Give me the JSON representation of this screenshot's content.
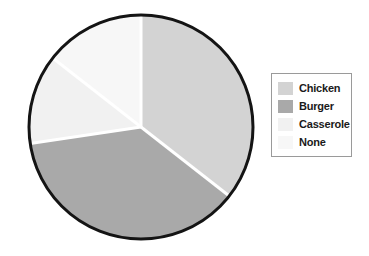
{
  "chart_data": {
    "type": "pie",
    "title": "",
    "labels": [
      "Chicken",
      "Burger",
      "Casserole",
      "None"
    ],
    "values": [
      35.6,
      37.1,
      12.9,
      14.4
    ],
    "angles_deg": [
      128.0,
      133.5,
      46.5,
      52.0
    ],
    "start_angle_deg": 0,
    "direction": "clockwise",
    "colors": [
      "#d3d3d3",
      "#a9a9a9",
      "#f1f1f1",
      "#f7f7f7"
    ],
    "slice_separator_color": "#ffffff",
    "outline_color": "#141414",
    "legend_position": "right",
    "grid": false,
    "xlabel": "",
    "ylabel": ""
  },
  "legend": {
    "items": [
      {
        "label": "Chicken",
        "color": "#d3d3d3"
      },
      {
        "label": "Burger",
        "color": "#a9a9a9"
      },
      {
        "label": "Casserole",
        "color": "#f1f1f1"
      },
      {
        "label": "None",
        "color": "#f7f7f7"
      }
    ]
  },
  "geometry": {
    "center_x": 115,
    "center_y": 119,
    "radius": 112
  }
}
